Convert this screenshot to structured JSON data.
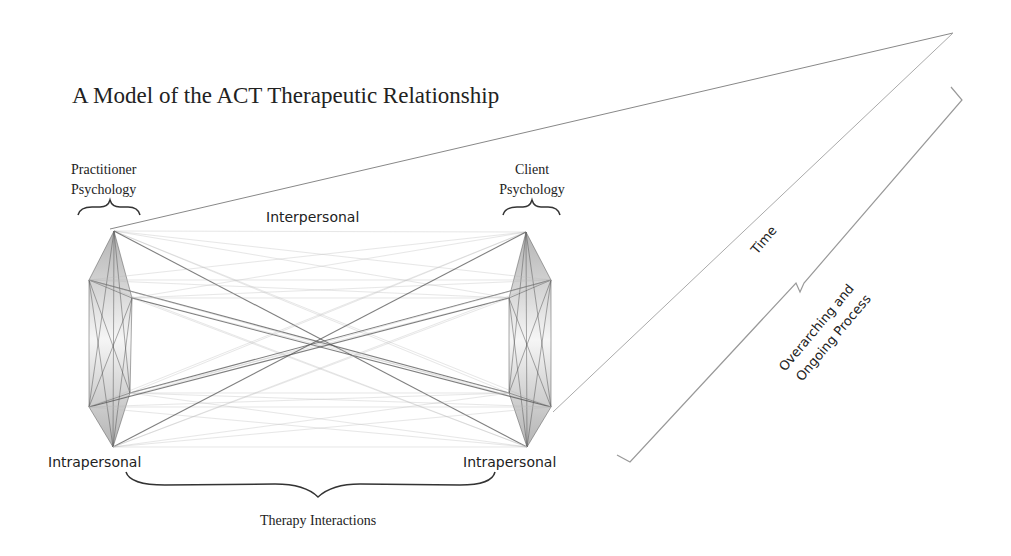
{
  "title": "A Model of the ACT Therapeutic Relationship",
  "labels": {
    "practitioner_line1": "Practitioner",
    "practitioner_line2": "Psychology",
    "client_line1": "Client",
    "client_line2": "Psychology",
    "interpersonal": "Interpersonal",
    "intrapersonal_left": "Intrapersonal",
    "intrapersonal_right": "Intrapersonal",
    "therapy_interactions": "Therapy Interactions",
    "time": "Time",
    "overarching_line1": "Overarching and",
    "overarching_line2": "Ongoing Process"
  },
  "nodes": {
    "left": [
      [
        114,
        231
      ],
      [
        89,
        280
      ],
      [
        132,
        298
      ],
      [
        130,
        393
      ],
      [
        89,
        407
      ],
      [
        113,
        447
      ]
    ],
    "right": [
      [
        526,
        232
      ],
      [
        551,
        280
      ],
      [
        509,
        298
      ],
      [
        509,
        393
      ],
      [
        551,
        407
      ],
      [
        527,
        447
      ]
    ]
  },
  "colors": {
    "line": "#555555",
    "light_line": "#bbbbbb",
    "text": "#222222"
  }
}
